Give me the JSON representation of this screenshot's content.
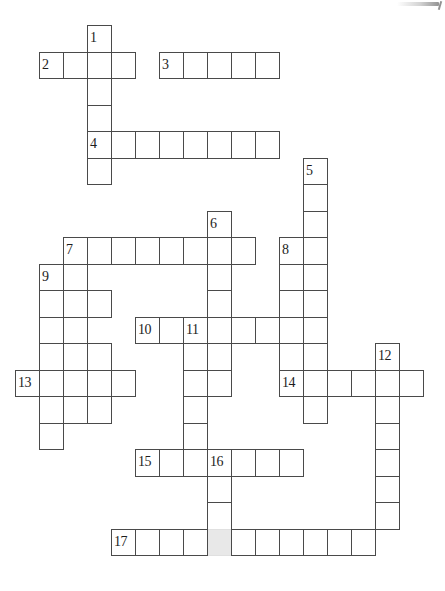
{
  "puzzle": {
    "type": "crossword-grid",
    "title": "Crossword puzzle grid",
    "cell_size": 24,
    "row_height": 26.5,
    "origin": {
      "x": 15,
      "y": 25
    },
    "grid_columns": 17,
    "grid_rows": 21,
    "colors": {
      "cell_border": "#4a4a4a",
      "cell_fill": "#ffffff",
      "number_text": "#1d1d1d",
      "shaded_fill": "#e8e8e8",
      "page_background": "#ffffff"
    },
    "entry_count": 17,
    "entries": [
      {
        "number": "1",
        "direction": "down",
        "col": 3,
        "row": 0,
        "length": 6
      },
      {
        "number": "2",
        "direction": "across",
        "col": 1,
        "row": 1,
        "length": 4
      },
      {
        "number": "3",
        "direction": "across",
        "col": 6,
        "row": 1,
        "length": 5
      },
      {
        "number": "4",
        "direction": "across",
        "col": 3,
        "row": 4,
        "length": 8
      },
      {
        "number": "5",
        "direction": "down",
        "col": 12,
        "row": 5,
        "length": 10
      },
      {
        "number": "6",
        "direction": "down",
        "col": 8,
        "row": 7,
        "length": 7
      },
      {
        "number": "7",
        "direction": "across",
        "col": 2,
        "row": 8,
        "length": 8
      },
      {
        "number": "8",
        "direction": "down",
        "col": 11,
        "row": 8,
        "length": 6
      },
      {
        "number": "9",
        "direction": "down",
        "col": 1,
        "row": 9,
        "length": 6
      },
      {
        "number": "10",
        "direction": "across",
        "col": 5,
        "row": 11,
        "length": 8
      },
      {
        "number": "11",
        "direction": "down",
        "col": 7,
        "row": 11,
        "length": 5
      },
      {
        "number": "12",
        "direction": "down",
        "col": 15,
        "row": 12,
        "length": 7
      },
      {
        "number": "13",
        "direction": "across",
        "col": 0,
        "row": 13,
        "length": 5
      },
      {
        "number": "14",
        "direction": "across",
        "col": 11,
        "row": 13,
        "length": 6
      },
      {
        "number": "15",
        "direction": "across",
        "col": 5,
        "row": 16,
        "length": 7
      },
      {
        "number": "16",
        "direction": "down",
        "col": 8,
        "row": 16,
        "length": 4
      },
      {
        "number": "17",
        "direction": "across",
        "col": 4,
        "row": 19,
        "length": 11
      }
    ],
    "extra_cells": [
      {
        "col": 3,
        "row": 5
      },
      {
        "col": 2,
        "row": 9
      },
      {
        "col": 2,
        "row": 10
      },
      {
        "col": 3,
        "row": 10
      },
      {
        "col": 2,
        "row": 11
      },
      {
        "col": 3,
        "row": 12
      },
      {
        "col": 1,
        "row": 12
      },
      {
        "col": 7,
        "row": 12
      },
      {
        "col": 8,
        "row": 12
      },
      {
        "col": 1,
        "row": 14
      },
      {
        "col": 2,
        "row": 14
      },
      {
        "col": 3,
        "row": 14
      },
      {
        "col": 1,
        "row": 15
      },
      {
        "col": 12,
        "row": 14
      },
      {
        "col": 8,
        "row": 17
      },
      {
        "col": 8,
        "row": 18
      }
    ],
    "shaded_cells": [
      {
        "col": 8,
        "row": 19
      }
    ]
  }
}
